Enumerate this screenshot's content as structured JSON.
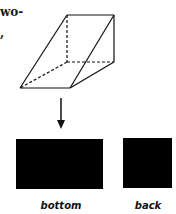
{
  "text_fragments": [
    "wo-",
    ","
  ],
  "figure": {
    "solid": "triangular-prism",
    "arrow": "view-from-top-down"
  },
  "views": [
    {
      "label": "bottom",
      "color": "#000000"
    },
    {
      "label": "back",
      "color": "#000000"
    }
  ]
}
